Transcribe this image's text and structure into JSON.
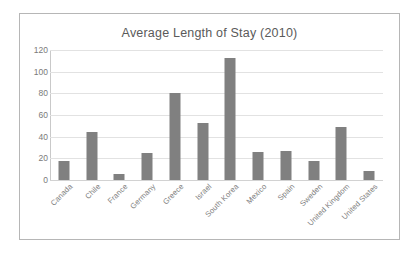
{
  "chart_data": {
    "type": "bar",
    "title": "Average Length of Stay (2010)",
    "xlabel": "",
    "ylabel": "",
    "ylim": [
      0,
      120
    ],
    "ytick_step": 20,
    "yticks": [
      120,
      100,
      80,
      60,
      40,
      20,
      0
    ],
    "grid": true,
    "legend": false,
    "bar_color": "#808080",
    "categories": [
      "Canada",
      "Chile",
      "France",
      "Germany",
      "Greece",
      "Israel",
      "South Korea",
      "Mexico",
      "Spain",
      "Sweden",
      "United Kingdom",
      "United States"
    ],
    "values": [
      17.5,
      44,
      6,
      25,
      80,
      53,
      113,
      26,
      27,
      17.5,
      49,
      8
    ]
  }
}
